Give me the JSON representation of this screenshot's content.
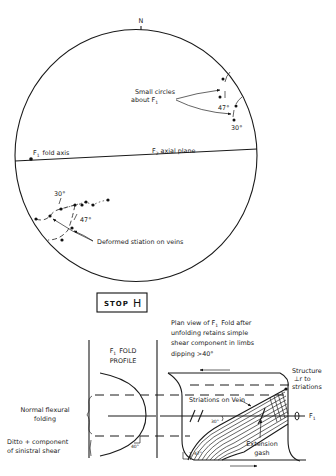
{
  "stereonet": {
    "north_label": "N",
    "small_circles_label_line1": "Small circles",
    "small_circles_label_line2": "about F",
    "small_circles_subscript": "1",
    "angle_47_upper": "47°",
    "angle_30_upper": "30°",
    "f1_fold_axis_label": "F",
    "f1_fold_axis_subscript": "1",
    "f1_fold_axis_text": "fold axis",
    "f2_axial_plane_label": "F",
    "f2_axial_plane_subscript": "2",
    "f2_axial_plane_text": "axial plane",
    "angle_30_lower": "30°",
    "angle_47_lower": "47°",
    "deformed_striation_label": "Deformed stiation on veins"
  },
  "stop_box": {
    "label": "STOP",
    "letter": "H"
  },
  "fold_diagram": {
    "plan_view_line1": "Plan view of F",
    "plan_view_sub": "1",
    "plan_view_line1_end": "Fold after",
    "plan_view_line2": "unfolding retains simple",
    "plan_view_line3": "shear component in limbs",
    "plan_view_line4": "dipping >40°",
    "profile_line1": "F",
    "profile_sub": "1",
    "profile_line1_end": "FOLD",
    "profile_line2": "PROFILE",
    "normal_flexural_line1": "Normal flexural",
    "normal_flexural_line2": "folding",
    "ditto_line1": "Ditto + component",
    "ditto_line2": "of sinistral shear",
    "profile_angle": "40°",
    "structure_line1": "Structure",
    "structure_line2": "⊥r to",
    "structure_line3": "striations",
    "striations_on_vein": "Striations on Vein",
    "angle_30": "30°",
    "angle_47": "47°",
    "f1_axis_label": "F",
    "f1_axis_sub": "1",
    "extension_gash_line1": "Extension",
    "extension_gash_line2": "gash"
  }
}
